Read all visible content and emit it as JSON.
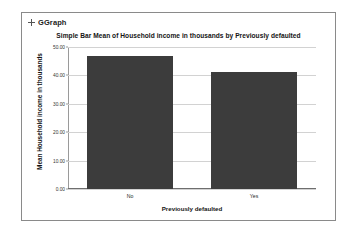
{
  "output": {
    "procedure_header": {
      "marker_icon": "plus-icon",
      "label": "GGraph"
    }
  },
  "chart_data": {
    "type": "bar",
    "title": "Simple Bar Mean of Household income in thousands by Previously defaulted",
    "xlabel": "Previously defaulted",
    "ylabel": "Mean Household income in thousands",
    "categories": [
      "No",
      "Yes"
    ],
    "values": [
      47.0,
      41.2
    ],
    "ylim": [
      0,
      50
    ],
    "yticks": [
      0,
      10,
      20,
      30,
      40,
      50
    ],
    "ytick_labels": [
      "0.00",
      "10.00",
      "20.00",
      "30.00",
      "40.00",
      "50.00"
    ],
    "grid": true,
    "legend": "none",
    "bar_color": "#3c3c3c",
    "gridline_color": "#d2d2d2",
    "axis_color": "#6e6e6e"
  }
}
